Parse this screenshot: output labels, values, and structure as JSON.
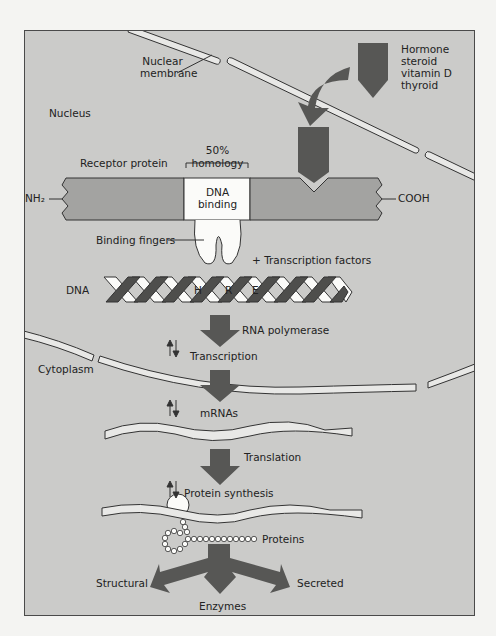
{
  "labels": {
    "nuclear_membrane_1": "Nuclear",
    "nuclear_membrane_2": "membrane",
    "hormone_1": "Hormone",
    "hormone_2": "steroid",
    "hormone_3": "vitamin D",
    "hormone_4": "thyroid",
    "nucleus": "Nucleus",
    "homology_pct": "50%",
    "homology": "homology",
    "receptor_protein": "Receptor protein",
    "dna_binding_1": "DNA",
    "dna_binding_2": "binding",
    "nh2": "NH₂",
    "cooh": "COOH",
    "binding_fingers": "Binding fingers",
    "transcription_factors": "+ Transcription factors",
    "dna": "DNA",
    "hre_h": "H",
    "hre_r": "R",
    "hre_e": "E",
    "rna_polymerase": "RNA polymerase",
    "transcription": "Transcription",
    "cytoplasm": "Cytoplasm",
    "mrnas": "mRNAs",
    "translation": "Translation",
    "protein_synthesis": "Protein synthesis",
    "proteins": "Proteins",
    "structural": "Structural",
    "secreted": "Secreted",
    "enzymes": "Enzymes"
  },
  "colors": {
    "background": "#cbcbc9",
    "protein_bar": "#a3a3a1",
    "arrow": "#575755",
    "white": "#ffffff"
  }
}
